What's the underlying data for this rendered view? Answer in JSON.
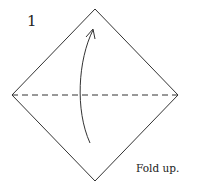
{
  "diagram": {
    "step_number": "1",
    "caption": "Fold up.",
    "shape": "square-diamond",
    "fold_line": "valley-fold-horizontal-dashed",
    "arrow": "curved-arrow-up",
    "colors": {
      "line": "#333333",
      "background": "#ffffff"
    }
  }
}
